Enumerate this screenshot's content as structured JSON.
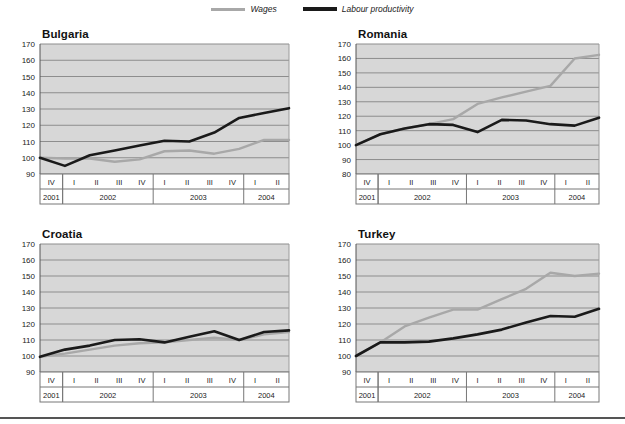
{
  "legend": {
    "items": [
      {
        "label": "Wages",
        "color": "#a8a8a8",
        "name": "legend-wages"
      },
      {
        "label": "Labour productivity",
        "color": "#1a1a1a",
        "name": "legend-labour-productivity"
      }
    ]
  },
  "axis": {
    "x_quarters": [
      "IV",
      "I",
      "II",
      "III",
      "IV",
      "I",
      "II",
      "III",
      "IV",
      "I",
      "II"
    ],
    "year_groups": [
      {
        "year": "2001",
        "quarters": [
          "IV"
        ]
      },
      {
        "year": "2002",
        "quarters": [
          "I",
          "II",
          "III",
          "IV"
        ]
      },
      {
        "year": "2003",
        "quarters": [
          "I",
          "II",
          "III",
          "IV"
        ]
      },
      {
        "year": "2004",
        "quarters": [
          "I",
          "II"
        ]
      }
    ]
  },
  "style": {
    "plot_bg": "#d7d7d7",
    "gridline": "#8d8d8d",
    "wages_color": "#a8a8a8",
    "productivity_color": "#1a1a1a",
    "axis_text": "#222222"
  },
  "chart_data": [
    {
      "type": "line",
      "title": "Bulgaria",
      "xlabel": "",
      "ylabel": "",
      "ylim": [
        90,
        170
      ],
      "yticks": [
        90,
        100,
        110,
        120,
        130,
        140,
        150,
        160,
        170
      ],
      "grid": true,
      "legend_position": "top-center",
      "x": [
        "2001 IV",
        "2002 I",
        "2002 II",
        "2002 III",
        "2002 IV",
        "2003 I",
        "2003 II",
        "2003 III",
        "2003 IV",
        "2004 I",
        "2004 II"
      ],
      "series": [
        {
          "name": "Wages",
          "values": [
            100,
            99.5,
            99.5,
            97.5,
            99,
            104,
            104.5,
            102.5,
            105.5,
            111,
            111
          ]
        },
        {
          "name": "Labour productivity",
          "values": [
            100,
            95,
            101.5,
            104.5,
            107.5,
            110.5,
            110,
            115.5,
            124.5,
            127.5,
            130.5
          ]
        }
      ]
    },
    {
      "type": "line",
      "title": "Romania",
      "xlabel": "",
      "ylabel": "",
      "ylim": [
        80,
        170
      ],
      "yticks": [
        80,
        90,
        100,
        110,
        120,
        130,
        140,
        150,
        160,
        170
      ],
      "grid": true,
      "legend_position": "top-center",
      "x": [
        "2001 IV",
        "2002 I",
        "2002 II",
        "2002 III",
        "2002 IV",
        "2003 I",
        "2003 II",
        "2003 III",
        "2003 IV",
        "2004 I",
        "2004 II"
      ],
      "series": [
        {
          "name": "Wages",
          "values": [
            100,
            107.5,
            111.5,
            114.5,
            118,
            128.5,
            133,
            137,
            141,
            160,
            162.5
          ]
        },
        {
          "name": "Labour productivity",
          "values": [
            100,
            107.5,
            111.5,
            114.5,
            114,
            109,
            117.5,
            117,
            114.5,
            113.5,
            119
          ]
        }
      ]
    },
    {
      "type": "line",
      "title": "Croatia",
      "xlabel": "",
      "ylabel": "",
      "ylim": [
        90,
        170
      ],
      "yticks": [
        90,
        100,
        110,
        120,
        130,
        140,
        150,
        160,
        170
      ],
      "grid": true,
      "legend_position": "top-center",
      "x": [
        "2001 IV",
        "2002 I",
        "2002 II",
        "2002 III",
        "2002 IV",
        "2003 I",
        "2003 II",
        "2003 III",
        "2003 IV",
        "2004 I",
        "2004 II"
      ],
      "series": [
        {
          "name": "Wages",
          "values": [
            99.5,
            101.5,
            104,
            106.5,
            108,
            108.5,
            110,
            111.5,
            110,
            113.5,
            115
          ]
        },
        {
          "name": "Labour productivity",
          "values": [
            99.5,
            104,
            106.5,
            110,
            110.5,
            108.5,
            112,
            115.5,
            110,
            115,
            116
          ]
        }
      ]
    },
    {
      "type": "line",
      "title": "Turkey",
      "xlabel": "",
      "ylabel": "",
      "ylim": [
        90,
        170
      ],
      "yticks": [
        90,
        100,
        110,
        120,
        130,
        140,
        150,
        160,
        170
      ],
      "grid": true,
      "legend_position": "top-center",
      "x": [
        "2001 IV",
        "2002 I",
        "2002 II",
        "2002 III",
        "2002 IV",
        "2003 I",
        "2003 II",
        "2003 III",
        "2003 IV",
        "2004 I",
        "2004 II"
      ],
      "series": [
        {
          "name": "Wages",
          "values": [
            100,
            108.5,
            118.5,
            124,
            129,
            129,
            135.5,
            142,
            152,
            150,
            151.5
          ]
        },
        {
          "name": "Labour productivity",
          "values": [
            100,
            108.5,
            108.5,
            109,
            111,
            113.5,
            116.5,
            121,
            125,
            124.5,
            129.5
          ]
        }
      ]
    }
  ]
}
